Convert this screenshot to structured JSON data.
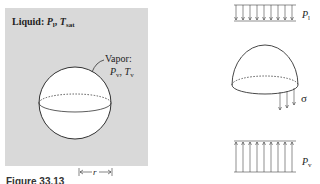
{
  "left_panel": {
    "liquid_label": "Liquid:",
    "liquid_p": "P",
    "liquid_p_sub": "l",
    "liquid_t": "T",
    "liquid_t_sub": "sat",
    "vapor_label": "Vapor:",
    "vapor_p": "P",
    "vapor_p_sub": "v",
    "vapor_t": "T",
    "vapor_t_sub": "v",
    "radius_label": "r",
    "box_color": "#d9d9d9"
  },
  "right_panel": {
    "top_pressure": "P",
    "top_pressure_sub": "l",
    "tension_label": "σ",
    "bottom_pressure": "P",
    "bottom_pressure_sub": "v"
  },
  "caption": "Figure 33.13"
}
